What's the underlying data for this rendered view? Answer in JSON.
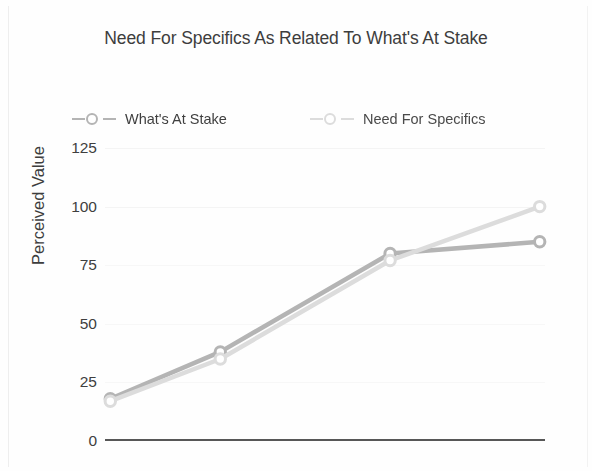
{
  "chart_data": {
    "type": "line",
    "title": "Need For Specifics As Related To What's At Stake",
    "xlabel": "",
    "ylabel": "Perceived Value",
    "ylim": [
      0,
      125
    ],
    "yticks": [
      125,
      100,
      75,
      50,
      25,
      0
    ],
    "ytick_labels": [
      "125",
      "100",
      "75",
      "50",
      "25",
      "0"
    ],
    "grid": true,
    "legend_position": "top",
    "x": [
      1,
      2,
      3,
      4
    ],
    "series": [
      {
        "name": "What's At Stake",
        "values": [
          18,
          38,
          80,
          85
        ],
        "color": "#b4b4b4",
        "marker": "circle"
      },
      {
        "name": "Need For Specifics",
        "values": [
          17,
          35,
          77,
          100
        ],
        "color": "#dcdcdc",
        "marker": "circle"
      }
    ]
  },
  "colors": {
    "axis": "#575757",
    "grid": "#f4f4f5",
    "text": "#3d3d3d",
    "background": "#ffffff"
  }
}
